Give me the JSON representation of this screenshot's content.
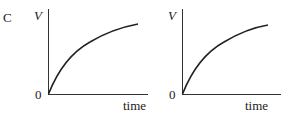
{
  "option_label": "C",
  "graphs": [
    {
      "id": "left",
      "y_axis_label": "V",
      "x_axis_label": "time",
      "origin_label": "0",
      "curve": "rising curve from origin with decreasing slope, approaching a plateau"
    },
    {
      "id": "right",
      "y_axis_label": "V",
      "x_axis_label": "time",
      "origin_label": "0",
      "curve": "rising curve from origin with decreasing slope, approaching a plateau"
    }
  ]
}
